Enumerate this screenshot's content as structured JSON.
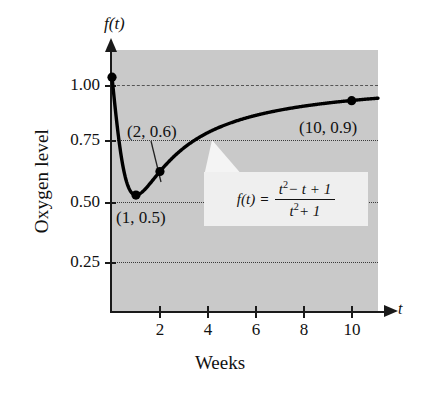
{
  "figure": {
    "axis_label_y": "f(t)",
    "axis_label_x": "t",
    "y_title": "Oxygen level",
    "x_title": "Weeks"
  },
  "formula": {
    "lhs": "f(t)",
    "equals": "=",
    "numerator_a": "t",
    "numerator_sup": "2",
    "numerator_b": "− t + 1",
    "denominator_a": "t",
    "denominator_sup": "2",
    "denominator_b": "+ 1"
  },
  "annotations": {
    "p1": "(2, 0.6)",
    "p2": "(1, 0.5)",
    "p3": "(10, 0.9)"
  },
  "colors": {
    "plot_background": "#c9c9c9",
    "curve": "#000000",
    "axis": "#1a1a1a",
    "formula_box": "#efefef"
  },
  "chart_data": {
    "type": "line",
    "title": "",
    "xlabel": "Weeks",
    "ylabel": "Oxygen level",
    "axis_symbol_x": "t",
    "axis_symbol_y": "f(t)",
    "function": "f(t) = (t^2 - t + 1) / (t^2 + 1)",
    "xlim": [
      0,
      11.1
    ],
    "ylim": [
      0,
      1.115
    ],
    "grid": true,
    "grid_lines_y": [
      0.25,
      0.5,
      0.75,
      1.0
    ],
    "grid_style": {
      "1.00": "dash-dot",
      "0.75": "dotted",
      "0.50": "dotted",
      "0.25": "dotted"
    },
    "legend": "none",
    "xticks": [
      2,
      4,
      6,
      8,
      10
    ],
    "xticklabels": [
      "2",
      "4",
      "6",
      "8",
      "10"
    ],
    "yticks": [
      0.25,
      0.5,
      0.75,
      1.0
    ],
    "yticklabels": [
      "0.25",
      "0.50",
      "0.75",
      "1.00"
    ],
    "series": [
      {
        "name": "f(t)",
        "x": [
          0,
          0.25,
          0.5,
          0.75,
          1,
          1.25,
          1.5,
          1.75,
          2,
          2.5,
          3,
          3.5,
          4,
          5,
          6,
          7,
          8,
          9,
          10,
          11
        ],
        "y": [
          1.0,
          0.7059,
          0.6,
          0.55,
          0.5,
          0.5122,
          0.5385,
          0.5702,
          0.6,
          0.6552,
          0.7,
          0.7358,
          0.7647,
          0.8077,
          0.8378,
          0.86,
          0.8769,
          0.8902,
          0.901,
          0.9098
        ]
      }
    ],
    "marked_points": [
      {
        "x": 0,
        "y": 1.0,
        "label": ""
      },
      {
        "x": 1,
        "y": 0.5,
        "label": "(1, 0.5)"
      },
      {
        "x": 2,
        "y": 0.6,
        "label": "(2, 0.6)"
      },
      {
        "x": 10,
        "y": 0.9,
        "label": "(10, 0.9)"
      }
    ]
  }
}
